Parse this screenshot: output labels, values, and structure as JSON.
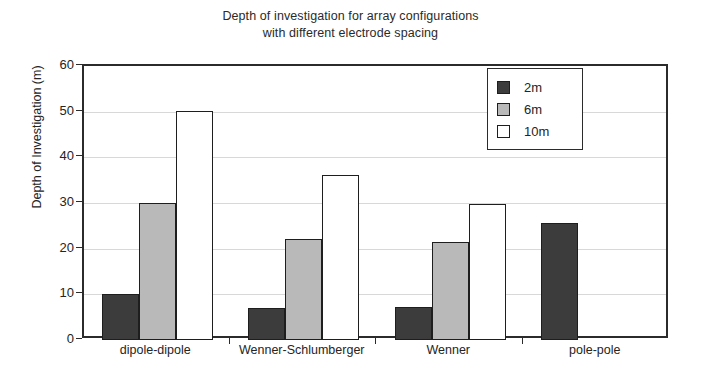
{
  "chart_data": {
    "type": "bar",
    "title": "Depth of investigation for array configurations with different electrode spacing",
    "title_lines": [
      "Depth of investigation for array configurations",
      "with different electrode spacing"
    ],
    "xlabel": "",
    "ylabel": "Depth of Investigation (m)",
    "ylim": [
      0,
      60
    ],
    "ytick_labels": [
      "0",
      "10",
      "20",
      "30",
      "40",
      "50",
      "60"
    ],
    "yticks": [
      0,
      10,
      20,
      30,
      40,
      50,
      60
    ],
    "grid": true,
    "grid_axis": "y",
    "legend_position": "upper right",
    "categories": [
      "dipole-dipole",
      "Wenner-Schlumberger",
      "Wenner",
      "pole-pole"
    ],
    "series": [
      {
        "name": "2m",
        "color": "#3c3c3c",
        "values": [
          10.0,
          7.0,
          7.2,
          25.6
        ]
      },
      {
        "name": "6m",
        "color": "#b9b9b9",
        "values": [
          30.0,
          22.2,
          21.4,
          null
        ]
      },
      {
        "name": "10m",
        "color": "#ffffff",
        "values": [
          50.2,
          36.2,
          29.7,
          null
        ]
      }
    ]
  },
  "legend": {
    "entries": [
      {
        "label": "2m"
      },
      {
        "label": "6m"
      },
      {
        "label": "10m"
      }
    ]
  },
  "colors": {
    "series_2m": "#3c3c3c",
    "series_6m": "#b9b9b9",
    "series_10m": "#ffffff",
    "axis": "#2b2b2b",
    "gridline": "#d8d8d8",
    "text": "#242424",
    "background": "#ffffff"
  }
}
